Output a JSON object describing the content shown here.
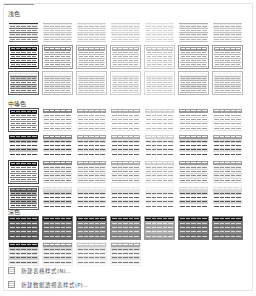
{
  "gallery": {
    "sections": [
      {
        "title": "浅色",
        "top": 9,
        "grid_top": 19,
        "rows": 3,
        "tiles": [
          {
            "name": "light-1",
            "header": "#ffffff",
            "band": "#e9e9e9",
            "line": "#7a7a7a",
            "cell": "#8a8a8a",
            "border": "none",
            "headerBorder": "#333"
          },
          {
            "name": "light-2",
            "header": "#ffffff",
            "band": "#f0f0f0",
            "line": "#c8c8c8",
            "cell": "#b8b8b8",
            "border": "none",
            "headerBorder": "#bbb"
          },
          {
            "name": "light-3",
            "header": "#ffffff",
            "band": "#f0f0f0",
            "line": "#cfcfcf",
            "cell": "#c0c0c0",
            "border": "none",
            "headerBorder": "#ccc"
          },
          {
            "name": "light-4",
            "header": "#ffffff",
            "band": "#f3f3f3",
            "line": "#d8d8d8",
            "cell": "#c8c8c8",
            "border": "none",
            "headerBorder": "#d0d0d0"
          },
          {
            "name": "light-5",
            "header": "#ffffff",
            "band": "#f5f5f5",
            "line": "#e0e0e0",
            "cell": "#d0d0d0",
            "border": "none",
            "headerBorder": "#ddd"
          },
          {
            "name": "light-6",
            "header": "#ffffff",
            "band": "#eeeeee",
            "line": "#bdbdbd",
            "cell": "#b0b0b0",
            "border": "none",
            "headerBorder": "#aaa"
          },
          {
            "name": "light-7",
            "header": "#ffffff",
            "band": "#efefef",
            "line": "#c4c4c4",
            "cell": "#b5b5b5",
            "border": "none",
            "headerBorder": "#bbb"
          },
          {
            "name": "light-8",
            "header": "#222222",
            "band": "#ffffff",
            "line": "#222",
            "cell": "#777",
            "border": "1px solid #444",
            "headerBorder": "#222"
          },
          {
            "name": "light-9",
            "header": "#8c8c8c",
            "band": "#ffffff",
            "line": "#aaa",
            "cell": "#999",
            "border": "1px solid #999",
            "headerBorder": "#8c8c8c"
          },
          {
            "name": "light-10",
            "header": "#a6a6a6",
            "band": "#ffffff",
            "line": "#bbb",
            "cell": "#aaa",
            "border": "1px solid #aaa",
            "headerBorder": "#a6a6a6"
          },
          {
            "name": "light-11",
            "header": "#b2b2b2",
            "band": "#ffffff",
            "line": "#c4c4c4",
            "cell": "#b0b0b0",
            "border": "1px solid #b5b5b5",
            "headerBorder": "#b2b2b2"
          },
          {
            "name": "light-12",
            "header": "#c8c8c8",
            "band": "#ffffff",
            "line": "#d4d4d4",
            "cell": "#bdbdbd",
            "border": "1px solid #c8c8c8",
            "headerBorder": "#c8c8c8"
          },
          {
            "name": "light-13",
            "header": "#9a9a9a",
            "band": "#ffffff",
            "line": "#b5b5b5",
            "cell": "#a5a5a5",
            "border": "1px solid #9a9a9a",
            "headerBorder": "#9a9a9a"
          },
          {
            "name": "light-14",
            "header": "#a0a0a0",
            "band": "#ffffff",
            "line": "#b8b8b8",
            "cell": "#a8a8a8",
            "border": "1px solid #a0a0a0",
            "headerBorder": "#a0a0a0"
          },
          {
            "name": "light-15",
            "header": "#e0e0e0",
            "band": "#cfcfcf",
            "line": "#777",
            "cell": "#777",
            "border": "1px solid #666",
            "headerBorder": "#666"
          },
          {
            "name": "light-16",
            "header": "#f3f3f3",
            "band": "#eaeaea",
            "line": "#bbb",
            "cell": "#aaa",
            "border": "1px solid #bbb",
            "headerBorder": "#bbb"
          },
          {
            "name": "light-17",
            "header": "#f5f5f5",
            "band": "#ededed",
            "line": "#c5c5c5",
            "cell": "#b5b5b5",
            "border": "1px solid #c5c5c5",
            "headerBorder": "#c5c5c5"
          },
          {
            "name": "light-18",
            "header": "#f6f6f6",
            "band": "#efefef",
            "line": "#cdcdcd",
            "cell": "#bdbdbd",
            "border": "1px solid #cdcdcd",
            "headerBorder": "#cdcdcd"
          },
          {
            "name": "light-19",
            "header": "#f8f8f8",
            "band": "#f2f2f2",
            "line": "#d6d6d6",
            "cell": "#c5c5c5",
            "border": "1px solid #d6d6d6",
            "headerBorder": "#d6d6d6"
          },
          {
            "name": "light-20",
            "header": "#f0f0f0",
            "band": "#e6e6e6",
            "line": "#b5b5b5",
            "cell": "#a5a5a5",
            "border": "1px solid #b5b5b5",
            "headerBorder": "#b5b5b5"
          },
          {
            "name": "light-21",
            "header": "#f2f2f2",
            "band": "#e8e8e8",
            "line": "#bcbcbc",
            "cell": "#acacac",
            "border": "1px solid #bcbcbc",
            "headerBorder": "#bcbcbc"
          }
        ]
      },
      {
        "title": "中等色",
        "top": 99,
        "grid_top": 108,
        "rows": 4,
        "tiles": [
          {
            "name": "medium-1",
            "header": "#1e1e1e",
            "band": "#ffffff",
            "line": "#999",
            "cell": "#777",
            "border": "1px solid #555",
            "headerBorder": "#1e1e1e"
          },
          {
            "name": "medium-2",
            "header": "#8a8a8a",
            "band": "#ffffff",
            "line": "#ddd",
            "cell": "#999",
            "border": "none",
            "headerBorder": "#8a8a8a"
          },
          {
            "name": "medium-3",
            "header": "#a4a4a4",
            "band": "#ffffff",
            "line": "#e0e0e0",
            "cell": "#a8a8a8",
            "border": "none",
            "headerBorder": "#a4a4a4"
          },
          {
            "name": "medium-4",
            "header": "#b0b0b0",
            "band": "#ffffff",
            "line": "#e4e4e4",
            "cell": "#aaa",
            "border": "none",
            "headerBorder": "#b0b0b0"
          },
          {
            "name": "medium-5",
            "header": "#d0d0d0",
            "band": "#ffffff",
            "line": "#eaeaea",
            "cell": "#b5b5b5",
            "border": "none",
            "headerBorder": "#d0d0d0"
          },
          {
            "name": "medium-6",
            "header": "#9c9c9c",
            "band": "#ffffff",
            "line": "#dedede",
            "cell": "#a0a0a0",
            "border": "none",
            "headerBorder": "#9c9c9c"
          },
          {
            "name": "medium-7",
            "header": "#a2a2a2",
            "band": "#ffffff",
            "line": "#e0e0e0",
            "cell": "#a5a5a5",
            "border": "none",
            "headerBorder": "#a2a2a2"
          },
          {
            "name": "medium-8",
            "header": "#1e1e1e",
            "band": "#c4c4c4",
            "line": "#fff",
            "cell": "#444",
            "border": "none",
            "headerBorder": "#1e1e1e"
          },
          {
            "name": "medium-9",
            "header": "#8a8a8a",
            "band": "#dcdcdc",
            "line": "#fff",
            "cell": "#555",
            "border": "none",
            "headerBorder": "#8a8a8a"
          },
          {
            "name": "medium-10",
            "header": "#a4a4a4",
            "band": "#e2e2e2",
            "line": "#fff",
            "cell": "#666",
            "border": "none",
            "headerBorder": "#a4a4a4"
          },
          {
            "name": "medium-11",
            "header": "#b0b0b0",
            "band": "#e6e6e6",
            "line": "#fff",
            "cell": "#666",
            "border": "none",
            "headerBorder": "#b0b0b0"
          },
          {
            "name": "medium-12",
            "header": "#d0d0d0",
            "band": "#eeeeee",
            "line": "#fff",
            "cell": "#777",
            "border": "none",
            "headerBorder": "#d0d0d0"
          },
          {
            "name": "medium-13",
            "header": "#9c9c9c",
            "band": "#dddddd",
            "line": "#fff",
            "cell": "#555",
            "border": "none",
            "headerBorder": "#9c9c9c"
          },
          {
            "name": "medium-14",
            "header": "#a2a2a2",
            "band": "#dfdfdf",
            "line": "#fff",
            "cell": "#5a5a5a",
            "border": "none",
            "headerBorder": "#a2a2a2"
          },
          {
            "name": "medium-15",
            "header": "#1e1e1e",
            "band": "#ffffff",
            "line": "#888",
            "cell": "#777",
            "border": "1px solid #444",
            "headerBorder": "#1e1e1e"
          },
          {
            "name": "medium-16",
            "header": "#8a8a8a",
            "band": "#f0f0f0",
            "line": "#ccc",
            "cell": "#888",
            "border": "none",
            "headerBorder": "#8a8a8a"
          },
          {
            "name": "medium-17",
            "header": "#a4a4a4",
            "band": "#f2f2f2",
            "line": "#d4d4d4",
            "cell": "#999",
            "border": "none",
            "headerBorder": "#a4a4a4"
          },
          {
            "name": "medium-18",
            "header": "#b0b0b0",
            "band": "#f3f3f3",
            "line": "#d8d8d8",
            "cell": "#999",
            "border": "none",
            "headerBorder": "#b0b0b0"
          },
          {
            "name": "medium-19",
            "header": "#d0d0d0",
            "band": "#f6f6f6",
            "line": "#e0e0e0",
            "cell": "#aaa",
            "border": "none",
            "headerBorder": "#d0d0d0"
          },
          {
            "name": "medium-20",
            "header": "#9c9c9c",
            "band": "#f1f1f1",
            "line": "#cfcfcf",
            "cell": "#8f8f8f",
            "border": "none",
            "headerBorder": "#9c9c9c"
          },
          {
            "name": "medium-21",
            "header": "#a2a2a2",
            "band": "#f1f1f1",
            "line": "#d2d2d2",
            "cell": "#939393",
            "border": "none",
            "headerBorder": "#a2a2a2"
          },
          {
            "name": "medium-22",
            "header": "#5a5a5a",
            "band": "#b8b8b8",
            "line": "#666",
            "cell": "#444",
            "border": "1px solid #666",
            "headerBorder": "#5a5a5a"
          },
          {
            "name": "medium-23",
            "header": "#dcdcdc",
            "band": "#d2d2d2",
            "line": "#fff",
            "cell": "#555",
            "border": "none",
            "headerBorder": "#dcdcdc"
          },
          {
            "name": "medium-24",
            "header": "#e6e6e6",
            "band": "#e0e0e0",
            "line": "#fff",
            "cell": "#666",
            "border": "none",
            "headerBorder": "#e6e6e6"
          },
          {
            "name": "medium-25",
            "header": "#e8e8e8",
            "band": "#e2e2e2",
            "line": "#fff",
            "cell": "#666",
            "border": "none",
            "headerBorder": "#e8e8e8"
          },
          {
            "name": "medium-26",
            "header": "#f0f0f0",
            "band": "#ebebeb",
            "line": "#fff",
            "cell": "#777",
            "border": "none",
            "headerBorder": "#f0f0f0"
          },
          {
            "name": "medium-27",
            "header": "#d8d8d8",
            "band": "#d6d6d6",
            "line": "#fff",
            "cell": "#555",
            "border": "none",
            "headerBorder": "#d8d8d8"
          },
          {
            "name": "medium-28",
            "header": "#dadada",
            "band": "#d8d8d8",
            "line": "#fff",
            "cell": "#5a5a5a",
            "border": "none",
            "headerBorder": "#dadada"
          }
        ]
      },
      {
        "title": "深色",
        "top": 207,
        "grid_top": 216,
        "rows": 2,
        "tiles": [
          {
            "name": "dark-1",
            "header": "#1a1a1a",
            "band": "#6a6a6a",
            "line": "#555",
            "cell": "#ddd",
            "border": "none",
            "headerBorder": "#1a1a1a",
            "body": "#5a5a5a"
          },
          {
            "name": "dark-2",
            "header": "#1a1a1a",
            "band": "#7a7a7a",
            "line": "#666",
            "cell": "#ddd",
            "border": "none",
            "headerBorder": "#1a1a1a",
            "body": "#6a6a6a"
          },
          {
            "name": "dark-3",
            "header": "#1a1a1a",
            "band": "#8a8a8a",
            "line": "#777",
            "cell": "#e0e0e0",
            "border": "none",
            "headerBorder": "#1a1a1a",
            "body": "#7a7a7a"
          },
          {
            "name": "dark-4",
            "header": "#1a1a1a",
            "band": "#939393",
            "line": "#808080",
            "cell": "#e2e2e2",
            "border": "none",
            "headerBorder": "#1a1a1a",
            "body": "#858585"
          },
          {
            "name": "dark-5",
            "header": "#1a1a1a",
            "band": "#b0b0b0",
            "line": "#9a9a9a",
            "cell": "#eee",
            "border": "none",
            "headerBorder": "#1a1a1a",
            "body": "#a0a0a0"
          },
          {
            "name": "dark-6",
            "header": "#1a1a1a",
            "band": "#7e7e7e",
            "line": "#6a6a6a",
            "cell": "#ddd",
            "border": "none",
            "headerBorder": "#1a1a1a",
            "body": "#707070"
          },
          {
            "name": "dark-7",
            "header": "#1a1a1a",
            "band": "#858585",
            "line": "#707070",
            "cell": "#ddd",
            "border": "none",
            "headerBorder": "#1a1a1a",
            "body": "#767676"
          },
          {
            "name": "dark-8",
            "header": "#1a1a1a",
            "band": "#d0d0d0",
            "line": "#fff",
            "cell": "#666",
            "border": "none",
            "headerBorder": "#1a1a1a",
            "body": "#e6e6e6"
          },
          {
            "name": "dark-9",
            "header": "#9a9a9a",
            "band": "#dcdcdc",
            "line": "#fff",
            "cell": "#777",
            "border": "none",
            "headerBorder": "#9a9a9a",
            "body": "#ececec"
          },
          {
            "name": "dark-10",
            "header": "#c8c8c8",
            "band": "#e6e6e6",
            "line": "#fff",
            "cell": "#888",
            "border": "none",
            "headerBorder": "#c8c8c8",
            "body": "#f2f2f2"
          },
          {
            "name": "dark-11",
            "header": "#a8a8a8",
            "band": "#dedede",
            "line": "#fff",
            "cell": "#7a7a7a",
            "border": "none",
            "headerBorder": "#a8a8a8",
            "body": "#eeeeee"
          }
        ]
      }
    ]
  },
  "menu": {
    "new_table_style": "新建表格样式(N)...",
    "new_pivot_style": "新建数据透视表样式(P)..."
  }
}
